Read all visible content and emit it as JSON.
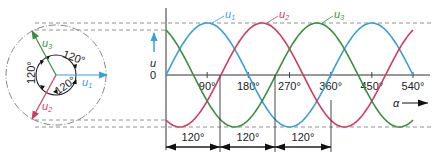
{
  "colors": {
    "u1": "#3a9fd8",
    "u2": "#d23a62",
    "u3": "#3a8f3e",
    "axis": "#333333",
    "dash": "#777777"
  },
  "phasor": {
    "labels": {
      "u1": "u",
      "u1_sub": "1",
      "u2": "u",
      "u2_sub": "2",
      "u3": "u",
      "u3_sub": "3"
    },
    "angles": [
      "120°",
      "120°",
      "120°"
    ]
  },
  "waveform": {
    "y_label": "u",
    "zero_label": "0",
    "x_label": "α",
    "x_ticks": [
      "90°",
      "180°",
      "270°",
      "360°",
      "450°",
      "540°"
    ],
    "curve_labels": {
      "u1": "u",
      "u1_sub": "1",
      "u2": "u",
      "u2_sub": "2",
      "u3": "u",
      "u3_sub": "3"
    }
  },
  "dimensions": [
    "120°",
    "120°",
    "120°"
  ],
  "chart_data": {
    "type": "line",
    "title": "",
    "xlabel": "α",
    "ylabel": "u",
    "xlim": [
      0,
      540
    ],
    "x_ticks": [
      90,
      180,
      270,
      360,
      450,
      540
    ],
    "series": [
      {
        "name": "u1",
        "formula": "sin(α)",
        "phase_deg": 0
      },
      {
        "name": "u2",
        "formula": "sin(α-120°)",
        "phase_deg": -120
      },
      {
        "name": "u3",
        "formula": "sin(α-240°)",
        "phase_deg": -240
      }
    ],
    "phase_shift_annotations": [
      "120°",
      "120°",
      "120°"
    ]
  }
}
